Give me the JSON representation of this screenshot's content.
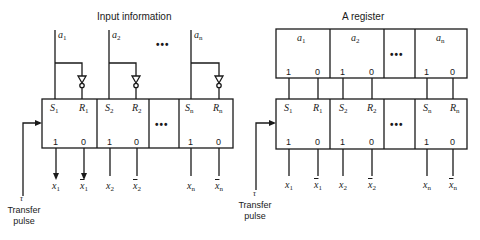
{
  "left": {
    "title": "Input information",
    "inputs": [
      {
        "name": "a",
        "sub": "1"
      },
      {
        "name": "a",
        "sub": "2"
      },
      {
        "name": "a",
        "sub": "n"
      }
    ],
    "cells": [
      {
        "s": "S",
        "r": "R",
        "sub": "1",
        "one": "1",
        "zero": "0"
      },
      {
        "s": "S",
        "r": "R",
        "sub": "2",
        "one": "1",
        "zero": "0"
      },
      {
        "s": "S",
        "r": "R",
        "sub": "n",
        "one": "1",
        "zero": "0"
      }
    ],
    "outputs": [
      {
        "name": "x",
        "sub": "1",
        "bar": false
      },
      {
        "name": "x",
        "sub": "1",
        "bar": true
      },
      {
        "name": "x",
        "sub": "2",
        "bar": false
      },
      {
        "name": "x",
        "sub": "2",
        "bar": true
      },
      {
        "name": "x",
        "sub": "n",
        "bar": false
      },
      {
        "name": "x",
        "sub": "n",
        "bar": true
      }
    ],
    "ellipsis": "•••",
    "clock": {
      "symbol": "τ",
      "line1": "Transfer",
      "line2": "pulse"
    }
  },
  "right": {
    "title": "A register",
    "register_cells": [
      {
        "name": "a",
        "sub": "1",
        "one": "1",
        "zero": "0"
      },
      {
        "name": "a",
        "sub": "2",
        "one": "1",
        "zero": "0"
      },
      {
        "name": "a",
        "sub": "n",
        "one": "1",
        "zero": "0"
      }
    ],
    "cells": [
      {
        "s": "S",
        "r": "R",
        "sub": "1",
        "one": "1",
        "zero": "0"
      },
      {
        "s": "S",
        "r": "R",
        "sub": "2",
        "one": "1",
        "zero": "0"
      },
      {
        "s": "S",
        "r": "R",
        "sub": "n",
        "one": "1",
        "zero": "0"
      }
    ],
    "outputs": [
      {
        "name": "x",
        "sub": "1",
        "bar": false
      },
      {
        "name": "x",
        "sub": "1",
        "bar": true
      },
      {
        "name": "x",
        "sub": "2",
        "bar": false
      },
      {
        "name": "x",
        "sub": "2",
        "bar": true
      },
      {
        "name": "x",
        "sub": "n",
        "bar": false
      },
      {
        "name": "x",
        "sub": "n",
        "bar": true
      }
    ],
    "ellipsis": "•••",
    "clock": {
      "symbol": "τ",
      "line1": "Transfer",
      "line2": "pulse"
    }
  }
}
